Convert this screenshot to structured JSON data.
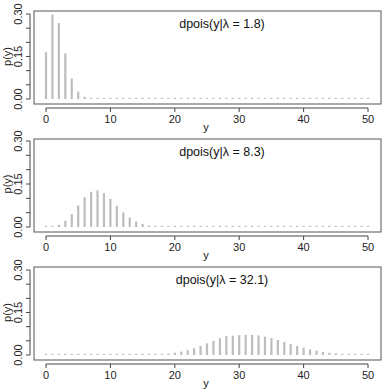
{
  "chart_data": [
    {
      "type": "bar",
      "title": "dpois(y|λ = 1.8)",
      "lambda": 1.8,
      "xlabel": "y",
      "ylabel": "p(y)",
      "xlim": [
        0,
        50
      ],
      "ylim": [
        0,
        0.3
      ],
      "xticks": [
        0,
        10,
        20,
        30,
        40,
        50
      ],
      "yticks": [
        "0.00",
        "0.15",
        "0.30"
      ],
      "x": [
        0,
        1,
        2,
        3,
        4,
        5,
        6,
        7,
        8,
        9,
        10,
        11,
        12,
        13,
        14,
        15,
        16,
        17,
        18,
        19,
        20,
        21,
        22,
        23,
        24,
        25,
        26,
        27,
        28,
        29,
        30,
        31,
        32,
        33,
        34,
        35,
        36,
        37,
        38,
        39,
        40,
        41,
        42,
        43,
        44,
        45,
        46,
        47,
        48,
        49,
        50
      ],
      "values": [
        0.165,
        0.298,
        0.268,
        0.161,
        0.072,
        0.026,
        0.008,
        0.002,
        0.0005,
        0.0001,
        0,
        0,
        0,
        0,
        0,
        0,
        0,
        0,
        0,
        0,
        0,
        0,
        0,
        0,
        0,
        0,
        0,
        0,
        0,
        0,
        0,
        0,
        0,
        0,
        0,
        0,
        0,
        0,
        0,
        0,
        0,
        0,
        0,
        0,
        0,
        0,
        0,
        0,
        0,
        0,
        0
      ]
    },
    {
      "type": "bar",
      "title": "dpois(y|λ = 8.3)",
      "lambda": 8.3,
      "xlabel": "y",
      "ylabel": "p(y)",
      "xlim": [
        0,
        50
      ],
      "ylim": [
        0,
        0.3
      ],
      "xticks": [
        0,
        10,
        20,
        30,
        40,
        50
      ],
      "yticks": [
        "0.00",
        "0.15",
        "0.30"
      ],
      "x": [
        0,
        1,
        2,
        3,
        4,
        5,
        6,
        7,
        8,
        9,
        10,
        11,
        12,
        13,
        14,
        15,
        16,
        17,
        18,
        19,
        20,
        21,
        22,
        23,
        24,
        25,
        26,
        27,
        28,
        29,
        30,
        31,
        32,
        33,
        34,
        35,
        36,
        37,
        38,
        39,
        40,
        41,
        42,
        43,
        44,
        45,
        46,
        47,
        48,
        49,
        50
      ],
      "values": [
        0.0002,
        0.002,
        0.008,
        0.022,
        0.045,
        0.075,
        0.104,
        0.123,
        0.128,
        0.118,
        0.098,
        0.074,
        0.051,
        0.033,
        0.019,
        0.011,
        0.005,
        0.003,
        0.001,
        0.0005,
        0.0002,
        0,
        0,
        0,
        0,
        0,
        0,
        0,
        0,
        0,
        0,
        0,
        0,
        0,
        0,
        0,
        0,
        0,
        0,
        0,
        0,
        0,
        0,
        0,
        0,
        0,
        0,
        0,
        0,
        0,
        0
      ]
    },
    {
      "type": "bar",
      "title": "dpois(y|λ = 32.1)",
      "lambda": 32.1,
      "xlabel": "y",
      "ylabel": "p(y)",
      "xlim": [
        0,
        50
      ],
      "ylim": [
        0,
        0.3
      ],
      "xticks": [
        0,
        10,
        20,
        30,
        40,
        50
      ],
      "yticks": [
        "0.00",
        "0.15",
        "0.30"
      ],
      "x": [
        0,
        1,
        2,
        3,
        4,
        5,
        6,
        7,
        8,
        9,
        10,
        11,
        12,
        13,
        14,
        15,
        16,
        17,
        18,
        19,
        20,
        21,
        22,
        23,
        24,
        25,
        26,
        27,
        28,
        29,
        30,
        31,
        32,
        33,
        34,
        35,
        36,
        37,
        38,
        39,
        40,
        41,
        42,
        43,
        44,
        45,
        46,
        47,
        48,
        49,
        50
      ],
      "values": [
        0,
        0,
        0,
        0,
        0,
        0,
        0,
        0,
        0,
        0,
        0,
        0,
        0,
        0,
        0,
        0,
        0.0009,
        0.0017,
        0.003,
        0.005,
        0.008,
        0.012,
        0.017,
        0.024,
        0.032,
        0.041,
        0.05,
        0.059,
        0.067,
        0.068,
        0.07,
        0.071,
        0.071,
        0.069,
        0.065,
        0.06,
        0.053,
        0.046,
        0.039,
        0.032,
        0.026,
        0.02,
        0.015,
        0.011,
        0.008,
        0.006,
        0.004,
        0.003,
        0.002,
        0.001,
        0.0007
      ]
    }
  ]
}
